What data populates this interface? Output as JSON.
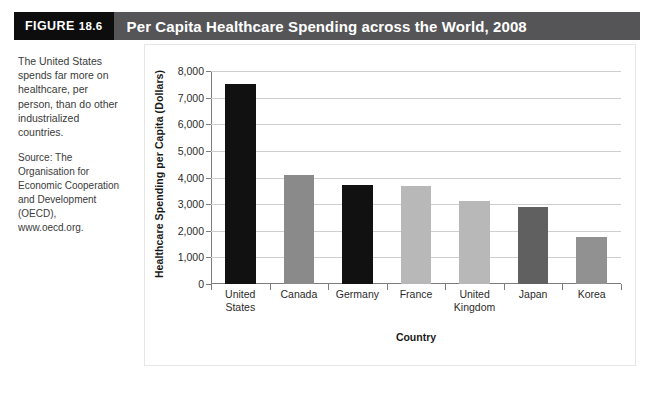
{
  "figure": {
    "tag_word": "FIGURE",
    "tag_number": "18.6",
    "title": "Per Capita Healthcare Spending across the World, 2008",
    "header_bg": "#555558",
    "tag_bg": "#0d0d0d"
  },
  "sidebar": {
    "caption": "The United States spends far more on healthcare, per person, than do other industrialized countries.",
    "source": "Source: The Organisation for Economic Cooperation and Development (OECD), www.oecd.org."
  },
  "chart_data": {
    "type": "bar",
    "title": "Per Capita Healthcare Spending across the World, 2008",
    "xlabel": "Country",
    "ylabel": "Healthcare Spending per Capita (Dollars)",
    "categories": [
      "United States",
      "Canada",
      "Germany",
      "France",
      "United Kingdom",
      "Japan",
      "Korea"
    ],
    "category_lines": [
      [
        "United",
        "States"
      ],
      [
        "Canada"
      ],
      [
        "Germany"
      ],
      [
        "France"
      ],
      [
        "United",
        "Kingdom"
      ],
      [
        "Japan"
      ],
      [
        "Korea"
      ]
    ],
    "values": [
      7520,
      4080,
      3710,
      3700,
      3130,
      2880,
      1770
    ],
    "bar_colors": [
      "#111111",
      "#8a8a8a",
      "#111111",
      "#b8b8b8",
      "#b8b8b8",
      "#606060",
      "#919191"
    ],
    "ylim": [
      0,
      8000
    ],
    "ytick_values": [
      0,
      1000,
      2000,
      3000,
      4000,
      5000,
      6000,
      7000,
      8000
    ],
    "ytick_labels": [
      "0",
      "1,000",
      "2,000",
      "3,000",
      "4,000",
      "5,000",
      "6,000",
      "7,000",
      "8,000"
    ],
    "grid": true,
    "legend": "none"
  }
}
